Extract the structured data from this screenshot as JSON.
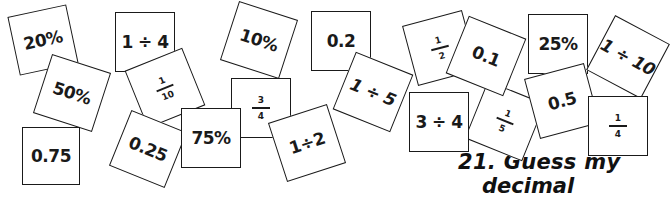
{
  "cards": [
    {
      "id": "c-20pct",
      "text": "20%",
      "type": "value",
      "cx": 43,
      "cy": 40,
      "size": 60,
      "rot": -12,
      "z": 1
    },
    {
      "id": "c-50pct",
      "text": "50%",
      "type": "value",
      "cx": 72,
      "cy": 93,
      "size": 62,
      "rot": 18,
      "z": 2
    },
    {
      "id": "c-075",
      "text": "0.75",
      "type": "value",
      "cx": 51,
      "cy": 156,
      "size": 58,
      "rot": 0,
      "z": 3
    },
    {
      "id": "c-1div4",
      "text": "1 ÷ 4",
      "type": "value",
      "cx": 145,
      "cy": 42,
      "size": 60,
      "rot": 0,
      "z": 1
    },
    {
      "id": "c-1over10",
      "num": "1",
      "den": "10",
      "type": "fraction",
      "cx": 165,
      "cy": 88,
      "size": 62,
      "rot": -22,
      "z": 2
    },
    {
      "id": "c-025",
      "text": "0.25",
      "type": "value",
      "cx": 148,
      "cy": 149,
      "size": 60,
      "rot": 22,
      "z": 3
    },
    {
      "id": "c-75pct",
      "text": "75%",
      "type": "value",
      "cx": 211,
      "cy": 138,
      "size": 60,
      "rot": 0,
      "z": 4
    },
    {
      "id": "c-10pct",
      "text": "10%",
      "type": "value",
      "cx": 259,
      "cy": 40,
      "size": 62,
      "rot": 18,
      "z": 1
    },
    {
      "id": "c-3over4",
      "num": "3",
      "den": "4",
      "type": "fraction",
      "cx": 261,
      "cy": 108,
      "size": 60,
      "rot": 0,
      "z": 2
    },
    {
      "id": "c-1div2",
      "text": "1÷2",
      "type": "value",
      "cx": 307,
      "cy": 143,
      "size": 62,
      "rot": -18,
      "z": 3
    },
    {
      "id": "c-02",
      "text": "0.2",
      "type": "value",
      "cx": 341,
      "cy": 41,
      "size": 60,
      "rot": 0,
      "z": 1
    },
    {
      "id": "c-1div5",
      "text": "1 ÷ 5",
      "type": "value",
      "italic": true,
      "cx": 373,
      "cy": 92,
      "size": 62,
      "rot": 22,
      "z": 2
    },
    {
      "id": "c-1over2",
      "num": "1",
      "den": "2",
      "type": "fraction",
      "cx": 440,
      "cy": 48,
      "size": 62,
      "rot": -15,
      "z": 1
    },
    {
      "id": "c-3div4",
      "text": "3 ÷ 4",
      "type": "value",
      "cx": 439,
      "cy": 122,
      "size": 60,
      "rot": 0,
      "z": 2
    },
    {
      "id": "c-01",
      "text": "0.1",
      "type": "value",
      "cx": 486,
      "cy": 56,
      "size": 62,
      "rot": 22,
      "z": 2
    },
    {
      "id": "c-1over5",
      "num": "1",
      "den": "5",
      "type": "fraction",
      "cx": 505,
      "cy": 121,
      "size": 62,
      "rot": 22,
      "z": 1
    },
    {
      "id": "c-25pct",
      "text": "25%",
      "type": "value",
      "cx": 558,
      "cy": 44,
      "size": 60,
      "rot": 0,
      "z": 1
    },
    {
      "id": "c-05",
      "text": "0.5",
      "type": "value",
      "cx": 562,
      "cy": 101,
      "size": 62,
      "rot": -15,
      "z": 2
    },
    {
      "id": "c-1div10",
      "text": "1 ÷ 10",
      "type": "value",
      "italic": true,
      "cx": 628,
      "cy": 57,
      "size": 62,
      "rot": 28,
      "z": 1
    },
    {
      "id": "c-1over4",
      "num": "1",
      "den": "4",
      "type": "fraction",
      "cx": 618,
      "cy": 126,
      "size": 60,
      "rot": 0,
      "z": 2
    }
  ],
  "heading": {
    "line1": "21. Guess my",
    "line2": "decimal"
  }
}
